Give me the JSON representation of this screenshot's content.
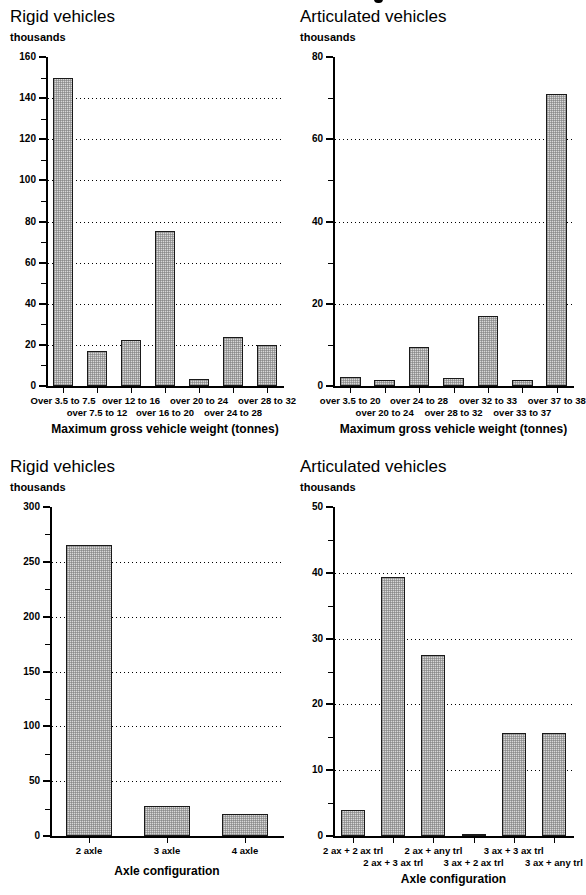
{
  "figure": {
    "panels": [
      {
        "id": "rigid-weight",
        "title": "Rigid vehicles",
        "unit": "thousands"
      },
      {
        "id": "artic-weight",
        "title": "Articulated vehicles",
        "unit": "thousands"
      },
      {
        "id": "rigid-axle",
        "title": "Rigid vehicles",
        "unit": "thousands"
      },
      {
        "id": "artic-axle",
        "title": "Articulated vehicles",
        "unit": "thousands"
      }
    ]
  },
  "chart_data": [
    {
      "id": "rigid-weight",
      "type": "bar",
      "title": "Rigid vehicles",
      "ylabel": "thousands",
      "xlabel": "Maximum gross vehicle weight (tonnes)",
      "ylim": [
        0,
        160
      ],
      "yticks": [
        0,
        20,
        40,
        60,
        80,
        100,
        120,
        140,
        160
      ],
      "yminor_step": 10,
      "grid": true,
      "legend": "none",
      "categories": [
        "Over 3.5 to 7.5",
        "over 7.5 to 12",
        "over 12 to 16",
        "over 16 to 20",
        "over 20 to 24",
        "over 24 to 28",
        "over 28 to 32"
      ],
      "values": [
        150,
        17,
        22.5,
        75.5,
        3.5,
        24,
        20
      ]
    },
    {
      "id": "artic-weight",
      "type": "bar",
      "title": "Articulated vehicles",
      "ylabel": "thousands",
      "xlabel": "Maximum gross vehicle weight (tonnes)",
      "ylim": [
        0,
        80
      ],
      "yticks": [
        0,
        20,
        40,
        60,
        80
      ],
      "yminor_step": 10,
      "grid": true,
      "legend": "none",
      "categories": [
        "over 3.5 to 20",
        "over 20 to 24",
        "over 24 to 28",
        "over 28 to 32",
        "over 32 to 33",
        "over 33 to 37",
        "over 37 to 38"
      ],
      "values": [
        2.2,
        1.4,
        9.5,
        2.0,
        17.0,
        1.4,
        71.0
      ]
    },
    {
      "id": "rigid-axle",
      "type": "bar",
      "title": "Rigid vehicles",
      "ylabel": "thousands",
      "xlabel": "Axle configuration",
      "ylim": [
        0,
        300
      ],
      "yticks": [
        0,
        50,
        100,
        150,
        200,
        250,
        300
      ],
      "yminor_step": 25,
      "grid": true,
      "legend": "none",
      "categories": [
        "2 axle",
        "3 axle",
        "4 axle"
      ],
      "values": [
        265,
        27,
        20
      ]
    },
    {
      "id": "artic-axle",
      "type": "bar",
      "title": "Articulated vehicles",
      "ylabel": "thousands",
      "xlabel": "Axle configuration",
      "ylim": [
        0,
        50
      ],
      "yticks": [
        0,
        10,
        20,
        30,
        40,
        50
      ],
      "yminor_step": 5,
      "grid": true,
      "legend": "none",
      "categories": [
        "2 ax + 2 ax trl",
        "2 ax + 3 ax trl",
        "2 ax + any trl",
        "3 ax + 2 ax trl",
        "3 ax + 3 ax trl",
        "3 ax + any trl"
      ],
      "values": [
        4.0,
        39.3,
        27.5,
        0.3,
        15.7,
        15.6
      ]
    }
  ]
}
